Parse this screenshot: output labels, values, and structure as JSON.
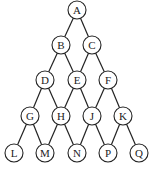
{
  "diagram": {
    "type": "graph",
    "node_radius": 9,
    "colors": {
      "stroke": "#222222",
      "fill": "#ffffff",
      "background": "#ffffff"
    },
    "nodes": [
      {
        "id": "A",
        "label": "A",
        "x": 77,
        "y": 10
      },
      {
        "id": "B",
        "label": "B",
        "x": 61,
        "y": 45
      },
      {
        "id": "C",
        "label": "C",
        "x": 92,
        "y": 45
      },
      {
        "id": "D",
        "label": "D",
        "x": 45,
        "y": 80
      },
      {
        "id": "E",
        "label": "E",
        "x": 77,
        "y": 80
      },
      {
        "id": "F",
        "label": "F",
        "x": 108,
        "y": 80
      },
      {
        "id": "G",
        "label": "G",
        "x": 30,
        "y": 116
      },
      {
        "id": "H",
        "label": "H",
        "x": 61,
        "y": 116
      },
      {
        "id": "J",
        "label": "J",
        "x": 92,
        "y": 116
      },
      {
        "id": "K",
        "label": "K",
        "x": 123,
        "y": 116
      },
      {
        "id": "L",
        "label": "L",
        "x": 14,
        "y": 153
      },
      {
        "id": "M",
        "label": "M",
        "x": 45,
        "y": 153
      },
      {
        "id": "N",
        "label": "N",
        "x": 77,
        "y": 153
      },
      {
        "id": "P",
        "label": "P",
        "x": 108,
        "y": 153
      },
      {
        "id": "Q",
        "label": "Q",
        "x": 139,
        "y": 153
      }
    ],
    "edges": [
      [
        "A",
        "B"
      ],
      [
        "A",
        "C"
      ],
      [
        "B",
        "D"
      ],
      [
        "B",
        "E"
      ],
      [
        "C",
        "E"
      ],
      [
        "C",
        "F"
      ],
      [
        "D",
        "G"
      ],
      [
        "D",
        "H"
      ],
      [
        "E",
        "H"
      ],
      [
        "E",
        "J"
      ],
      [
        "F",
        "J"
      ],
      [
        "F",
        "K"
      ],
      [
        "G",
        "L"
      ],
      [
        "G",
        "M"
      ],
      [
        "H",
        "M"
      ],
      [
        "H",
        "N"
      ],
      [
        "J",
        "N"
      ],
      [
        "J",
        "P"
      ],
      [
        "K",
        "P"
      ],
      [
        "K",
        "Q"
      ]
    ]
  }
}
